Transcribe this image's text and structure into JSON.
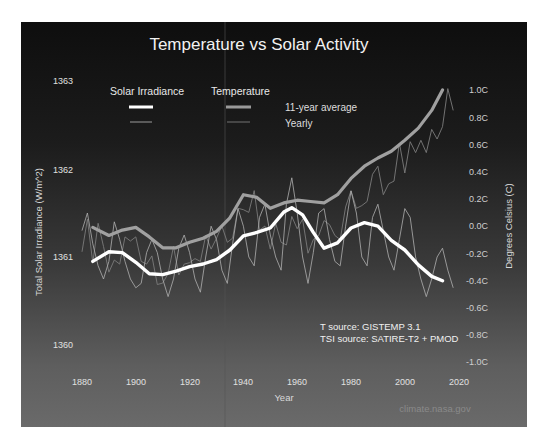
{
  "chart_data": {
    "type": "line",
    "title": "Temperature vs Solar Activity",
    "xlabel": "Year",
    "ylabel_left": "Total Solar Irradiance (W/m^2)",
    "ylabel_right": "Degrees Celsius (C)",
    "x_ticks": [
      "1880",
      "1900",
      "1920",
      "1940",
      "1960",
      "1980",
      "2000",
      "2020"
    ],
    "y_left_ticks": [
      "1363",
      "1362",
      "1361",
      "1360"
    ],
    "y_right_ticks": [
      "1.0C",
      "0.8C",
      "0.6C",
      "0.4C",
      "0.2C",
      "0.0C",
      "-0.2C",
      "-0.4C",
      "-0.6C",
      "-0.8C",
      "-1.0C"
    ],
    "xlim": [
      1880,
      2020
    ],
    "ylim_left": [
      1360,
      1363
    ],
    "ylim_right": [
      -1.0,
      1.0
    ],
    "grid": false,
    "legend": {
      "position": "top-left",
      "groups": [
        "Solar Irradiance",
        "Temperature"
      ],
      "styles": [
        "11-year average",
        "Yearly"
      ]
    },
    "annotations": [
      "T source: GISTEMP 3.1",
      "TSI source: SATIRE-T2 + PMOD",
      "climate.nasa.gov"
    ],
    "series": [
      {
        "name": "Temperature 11-year average",
        "axis": "right",
        "color": "#9a9a9a",
        "x": [
          1884,
          1890,
          1895,
          1900,
          1905,
          1910,
          1915,
          1920,
          1925,
          1930,
          1935,
          1940,
          1945,
          1950,
          1955,
          1960,
          1965,
          1970,
          1975,
          1980,
          1985,
          1990,
          1995,
          2000,
          2005,
          2010,
          2014
        ],
        "values": [
          -0.01,
          -0.07,
          -0.03,
          -0.01,
          -0.08,
          -0.16,
          -0.16,
          -0.12,
          -0.09,
          -0.04,
          0.06,
          0.23,
          0.21,
          0.13,
          0.17,
          0.19,
          0.18,
          0.17,
          0.23,
          0.35,
          0.44,
          0.5,
          0.55,
          0.63,
          0.72,
          0.85,
          1.0
        ]
      },
      {
        "name": "Temperature yearly",
        "axis": "right",
        "color": "#7c7c7c",
        "x": [
          1880,
          1882,
          1884,
          1886,
          1888,
          1890,
          1892,
          1894,
          1896,
          1898,
          1900,
          1902,
          1904,
          1906,
          1908,
          1910,
          1912,
          1914,
          1916,
          1918,
          1920,
          1922,
          1924,
          1926,
          1928,
          1930,
          1932,
          1934,
          1936,
          1938,
          1940,
          1942,
          1944,
          1946,
          1948,
          1950,
          1952,
          1954,
          1956,
          1958,
          1960,
          1962,
          1964,
          1966,
          1968,
          1970,
          1972,
          1974,
          1976,
          1978,
          1980,
          1982,
          1984,
          1986,
          1988,
          1990,
          1992,
          1994,
          1996,
          1998,
          2000,
          2002,
          2004,
          2006,
          2008,
          2010,
          2012,
          2014,
          2016,
          2018
        ],
        "values": [
          -0.19,
          0.05,
          -0.27,
          0.02,
          -0.15,
          -0.34,
          -0.25,
          -0.28,
          -0.08,
          -0.11,
          -0.08,
          -0.26,
          -0.28,
          -0.22,
          -0.43,
          -0.42,
          -0.35,
          -0.15,
          -0.36,
          -0.28,
          -0.27,
          -0.24,
          -0.26,
          -0.07,
          -0.17,
          -0.09,
          0.0,
          -0.12,
          -0.09,
          0.13,
          0.12,
          0.1,
          0.26,
          -0.03,
          0.0,
          -0.17,
          0.02,
          -0.12,
          -0.14,
          0.07,
          -0.02,
          0.05,
          -0.2,
          -0.1,
          -0.07,
          0.04,
          0.01,
          -0.07,
          -0.1,
          0.14,
          0.26,
          0.13,
          0.15,
          0.18,
          0.38,
          0.44,
          0.23,
          0.31,
          0.33,
          0.61,
          0.39,
          0.62,
          0.54,
          0.63,
          0.54,
          0.71,
          0.64,
          0.73,
          1.01,
          0.85
        ]
      },
      {
        "name": "Solar Irradiance 11-year average",
        "axis": "left",
        "color": "#ffffff",
        "x": [
          1884,
          1890,
          1895,
          1900,
          1905,
          1910,
          1915,
          1920,
          1925,
          1930,
          1935,
          1940,
          1945,
          1950,
          1955,
          1958,
          1962,
          1966,
          1970,
          1975,
          1980,
          1985,
          1990,
          1995,
          2000,
          2005,
          2010,
          2014
        ],
        "values": [
          1360.95,
          1361.06,
          1361.05,
          1360.94,
          1360.81,
          1360.8,
          1360.84,
          1360.89,
          1360.92,
          1360.97,
          1361.08,
          1361.24,
          1361.28,
          1361.33,
          1361.51,
          1361.56,
          1361.48,
          1361.28,
          1361.1,
          1361.16,
          1361.33,
          1361.39,
          1361.35,
          1361.19,
          1361.08,
          1360.91,
          1360.78,
          1360.73
        ]
      },
      {
        "name": "Solar Irradiance yearly",
        "axis": "left",
        "color": "#bdbdbd",
        "x": [
          1880,
          1882,
          1884,
          1886,
          1888,
          1890,
          1892,
          1894,
          1896,
          1898,
          1900,
          1902,
          1904,
          1906,
          1908,
          1910,
          1912,
          1914,
          1916,
          1918,
          1920,
          1922,
          1924,
          1926,
          1928,
          1930,
          1932,
          1934,
          1936,
          1938,
          1940,
          1942,
          1944,
          1946,
          1948,
          1950,
          1952,
          1954,
          1956,
          1958,
          1960,
          1962,
          1964,
          1966,
          1968,
          1970,
          1972,
          1974,
          1976,
          1978,
          1980,
          1982,
          1984,
          1986,
          1988,
          1990,
          1992,
          1994,
          1996,
          1998,
          2000,
          2002,
          2004,
          2006,
          2008,
          2010,
          2012,
          2014,
          2016,
          2018
        ],
        "values": [
          1361.3,
          1361.5,
          1361.15,
          1360.9,
          1360.75,
          1360.95,
          1361.4,
          1361.2,
          1360.95,
          1360.75,
          1360.65,
          1360.7,
          1361.05,
          1361.2,
          1361.05,
          1360.75,
          1360.55,
          1360.75,
          1361.1,
          1361.25,
          1361.05,
          1360.75,
          1360.6,
          1361.0,
          1361.35,
          1361.2,
          1360.85,
          1360.7,
          1361.15,
          1361.55,
          1361.35,
          1361.0,
          1360.9,
          1361.45,
          1361.6,
          1361.25,
          1361.0,
          1360.85,
          1361.6,
          1361.9,
          1361.5,
          1361.0,
          1360.7,
          1361.05,
          1361.5,
          1361.55,
          1361.2,
          1360.95,
          1360.9,
          1361.35,
          1361.75,
          1361.5,
          1361.0,
          1360.9,
          1361.45,
          1361.6,
          1361.3,
          1361.0,
          1360.85,
          1361.2,
          1361.55,
          1361.45,
          1361.0,
          1360.75,
          1360.55,
          1360.75,
          1361.0,
          1361.1,
          1360.85,
          1360.65
        ]
      }
    ]
  },
  "labels": {
    "title": "Temperature vs Solar Activity",
    "legend_solar": "Solar Irradiance",
    "legend_temp": "Temperature",
    "legend_avg": "11-year average",
    "legend_yearly": "Yearly",
    "xlabel": "Year",
    "ylabel_left": "Total Solar Irradiance (W/m^2)",
    "ylabel_right": "Degrees Celsius (C)",
    "source_t": "T source: GISTEMP 3.1",
    "source_tsi": "TSI source: SATIRE-T2 + PMOD",
    "credit": "climate.nasa.gov"
  },
  "ticks": {
    "x": [
      "1880",
      "1900",
      "1920",
      "1940",
      "1960",
      "1980",
      "2000",
      "2020"
    ],
    "left": [
      "1363",
      "1362",
      "1361",
      "1360"
    ],
    "right": [
      "1.0C",
      "0.8C",
      "0.6C",
      "0.4C",
      "0.2C",
      "0.0C",
      "-0.2C",
      "-0.4C",
      "-0.6C",
      "-0.8C",
      "-1.0C"
    ]
  }
}
